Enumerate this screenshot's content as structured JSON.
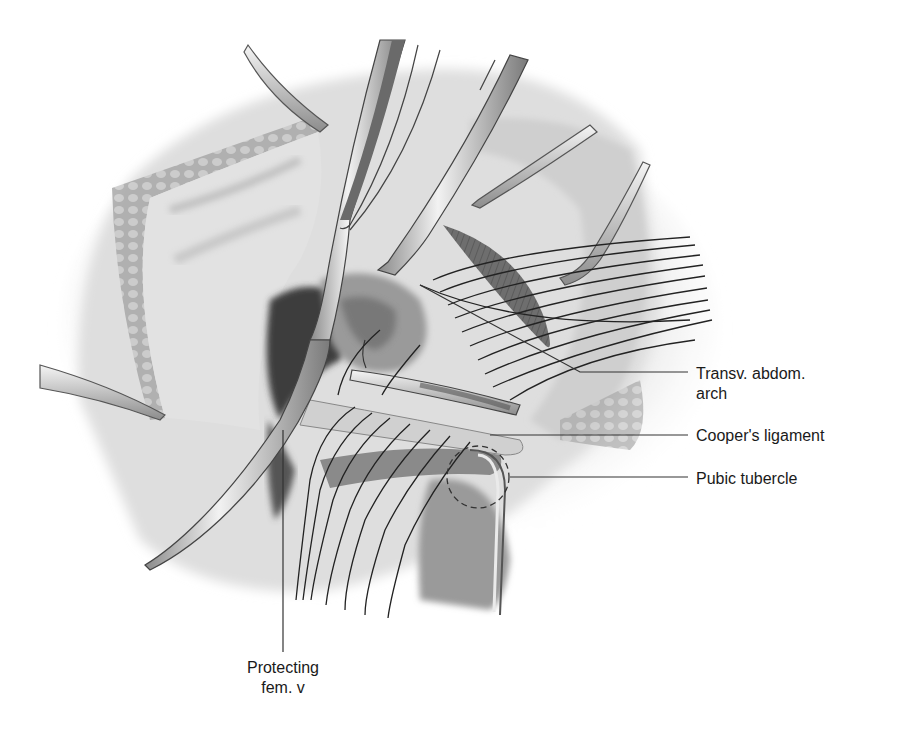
{
  "figure": {
    "palette": {
      "background": "#ffffff",
      "tissue_light": "#e6e6e6",
      "tissue_mid": "#b5b5b5",
      "tissue_dark": "#5a5a5a",
      "suture": "#222222",
      "leader_line": "#333333",
      "label_text": "#1a1a1a"
    }
  },
  "labels": [
    {
      "id": "transv-abdom-arch",
      "line1": "Transv. abdom.",
      "line2": "arch"
    },
    {
      "id": "coopers-ligament",
      "line1": "Cooper's ligament"
    },
    {
      "id": "pubic-tubercle",
      "line1": "Pubic tubercle"
    },
    {
      "id": "protecting-fem-v",
      "line1": "Protecting",
      "line2": "fem. v"
    }
  ]
}
